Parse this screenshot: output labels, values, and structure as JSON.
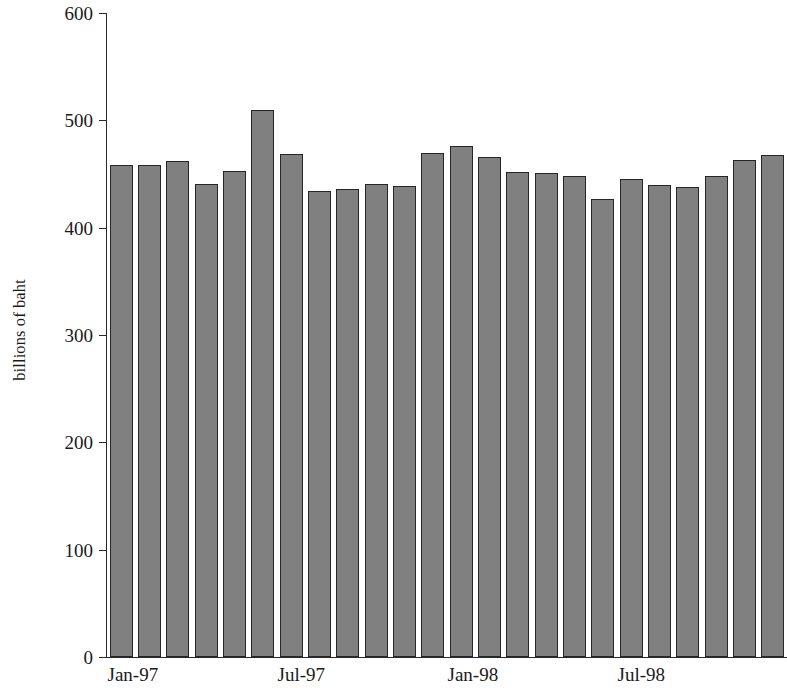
{
  "chart_data": {
    "type": "bar",
    "title": "",
    "subtitle": "",
    "xlabel": "",
    "ylabel": "billions of baht",
    "ylim": [
      0,
      600
    ],
    "ytick_values": [
      0,
      100,
      200,
      300,
      400,
      500,
      600
    ],
    "ytick_labels": [
      "0",
      "100",
      "200",
      "300",
      "400",
      "500",
      "600"
    ],
    "grid": false,
    "legend": null,
    "bar_color": "#808080",
    "bar_edge_color": "#262626",
    "axis_color": "#2a2a2a",
    "categories": [
      "Jan-97",
      "Feb-97",
      "Mar-97",
      "Apr-97",
      "May-97",
      "Jun-97",
      "Jul-97",
      "Aug-97",
      "Sep-97",
      "Oct-97",
      "Nov-97",
      "Dec-97",
      "Jan-98",
      "Feb-98",
      "Mar-98",
      "Apr-98",
      "May-98",
      "Jun-98",
      "Jul-98",
      "Aug-98",
      "Sep-98",
      "Oct-98",
      "Nov-98",
      "Dec-98"
    ],
    "values": [
      458,
      458,
      462,
      441,
      453,
      510,
      469,
      434,
      436,
      441,
      439,
      470,
      476,
      466,
      452,
      451,
      448,
      427,
      445,
      440,
      438,
      448,
      463,
      468
    ],
    "xtick_labels": [
      "Jan-97",
      "Jul-97",
      "Jan-98",
      "Jul-98"
    ],
    "xtick_category_indices": [
      0,
      6,
      12,
      18
    ]
  }
}
